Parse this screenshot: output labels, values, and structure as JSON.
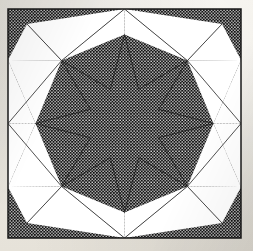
{
  "document": {
    "title": "Eight-Pointed Star Quilt Block",
    "medium": "scanned printed pattern diagram",
    "paper_color": "#efece5",
    "ink_color": "#121212",
    "fill_color": "#ffffff"
  },
  "block": {
    "name": "eight-pointed-star-quilt-block",
    "outline": {
      "x": 8,
      "y": 9,
      "width": 233,
      "height": 229
    },
    "border_color": "#1a1a1a",
    "border_width": 1.5,
    "texture": {
      "name": "halftone-dot-fill",
      "description": "fine white dots on black ground",
      "dot_color": "#ffffff",
      "ground_color": "#121212",
      "pitch": 3.1,
      "dot_radius": 0.72
    }
  },
  "chart_data": {
    "type": "diagram",
    "symmetry": "4-fold rotational with mirror axes (dihedral D4)",
    "center": {
      "x": 124.5,
      "y": 123.5
    },
    "star": {
      "name": "central-eight-pointed-star",
      "points": 8,
      "fill": "dotted",
      "outer_radius": 89,
      "inner_radius": 37,
      "rotation_deg": -90,
      "tips": [
        {
          "label": "north",
          "x": 124.5,
          "y": 34.5
        },
        {
          "label": "northeast",
          "x": 187.4,
          "y": 60.6
        },
        {
          "label": "east",
          "x": 213.5,
          "y": 123.5
        },
        {
          "label": "southeast",
          "x": 187.4,
          "y": 186.4
        },
        {
          "label": "south",
          "x": 124.5,
          "y": 212.5
        },
        {
          "label": "southwest",
          "x": 61.6,
          "y": 186.4
        },
        {
          "label": "west",
          "x": 35.5,
          "y": 123.5
        },
        {
          "label": "northwest",
          "x": 61.6,
          "y": 60.6
        }
      ]
    },
    "white_wedges": {
      "description": "radiating light triangular wedges between star points and block edge",
      "count": 16,
      "fill": "#ffffff"
    },
    "edge_contacts": [
      {
        "edge": "top",
        "x": 124.5,
        "y": 9
      },
      {
        "edge": "right",
        "x": 241,
        "y": 123.5
      },
      {
        "edge": "bottom",
        "x": 124.5,
        "y": 238
      },
      {
        "edge": "left",
        "x": 8,
        "y": 123.5
      }
    ],
    "corners_filled": true
  }
}
